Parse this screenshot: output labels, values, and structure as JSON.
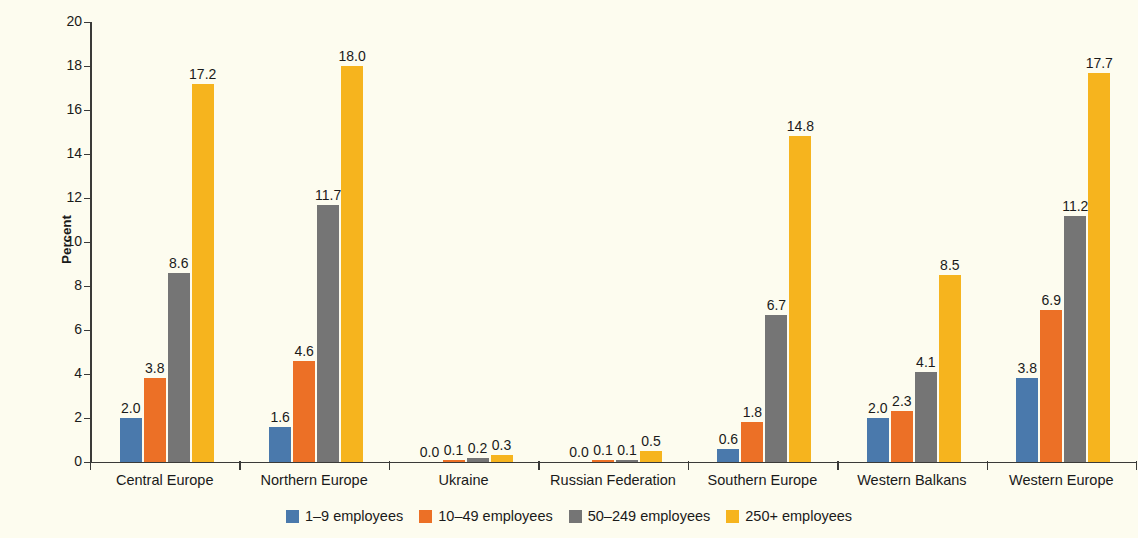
{
  "chart_data": {
    "type": "bar",
    "title": "",
    "subtitle": "",
    "xlabel": "",
    "ylabel": "Percent",
    "ylim": [
      0,
      20
    ],
    "ytick_step": 2,
    "yticks": [
      "20",
      "18",
      "16",
      "14",
      "12",
      "10",
      "8",
      "6",
      "4",
      "2",
      "0"
    ],
    "grid": false,
    "legend_position": "bottom",
    "categories": [
      "Central Europe",
      "Northern Europe",
      "Ukraine",
      "Russian Federation",
      "Southern Europe",
      "Western Balkans",
      "Western Europe"
    ],
    "series": [
      {
        "name": "1–9 employees",
        "color": "#4a79ac",
        "values": [
          2.0,
          1.6,
          0.0,
          0.0,
          0.6,
          2.0,
          3.8
        ],
        "labels": [
          "2.0",
          "1.6",
          "0.0",
          "0.0",
          "0.6",
          "2.0",
          "3.8"
        ]
      },
      {
        "name": "10–49 employees",
        "color": "#ec7026",
        "values": [
          3.8,
          4.6,
          0.1,
          0.1,
          1.8,
          2.3,
          6.9
        ],
        "labels": [
          "3.8",
          "4.6",
          "0.1",
          "0.1",
          "1.8",
          "2.3",
          "6.9"
        ]
      },
      {
        "name": "50–249 employees",
        "color": "#757575",
        "values": [
          8.6,
          11.7,
          0.2,
          0.1,
          6.7,
          4.1,
          11.2
        ],
        "labels": [
          "8.6",
          "11.7",
          "0.2",
          "0.1",
          "6.7",
          "4.1",
          "11.2"
        ]
      },
      {
        "name": "250+ employees",
        "color": "#f6b41e",
        "values": [
          17.2,
          18.0,
          0.3,
          0.5,
          14.8,
          8.5,
          17.7
        ],
        "labels": [
          "17.2",
          "18.0",
          "0.3",
          "0.5",
          "14.8",
          "8.5",
          "17.7"
        ]
      }
    ]
  },
  "legend": {
    "items": [
      {
        "label": "1–9 employees",
        "color": "#4a79ac"
      },
      {
        "label": "10–49 employees",
        "color": "#ec7026"
      },
      {
        "label": "50–249 employees",
        "color": "#757575"
      },
      {
        "label": "250+ employees",
        "color": "#f6b41e"
      }
    ]
  },
  "colors": {
    "background": "#fdfcef",
    "axis": "#3a3a38",
    "text": "#1a1a1a"
  }
}
